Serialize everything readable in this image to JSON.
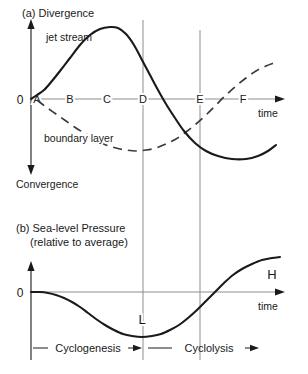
{
  "figure": {
    "width": 308,
    "height": 374,
    "background": "#ffffff",
    "ink": "#1a1a1a",
    "grid_color": "#8d8d8d"
  },
  "panel_a": {
    "title": "(a) Divergence",
    "axis_top_label": "Divergence",
    "axis_bottom_label": "Convergence",
    "x_axis_label": "time",
    "zero_label": "0",
    "tick_labels": [
      "A",
      "B",
      "C",
      "D",
      "E",
      "F"
    ],
    "tick_x": [
      37,
      70,
      107,
      143,
      200,
      243
    ],
    "curves": [
      {
        "name": "jet stream",
        "style": "solid",
        "label": "jet stream",
        "label_x": 46,
        "label_y": 41,
        "points": [
          [
            31,
            99
          ],
          [
            37,
            95
          ],
          [
            44,
            90
          ],
          [
            52,
            81
          ],
          [
            60,
            71
          ],
          [
            70,
            58
          ],
          [
            80,
            45
          ],
          [
            90,
            35
          ],
          [
            100,
            29
          ],
          [
            110,
            27
          ],
          [
            118,
            28
          ],
          [
            126,
            34
          ],
          [
            134,
            45
          ],
          [
            142,
            60
          ],
          [
            150,
            75
          ],
          [
            158,
            90
          ],
          [
            166,
            104
          ],
          [
            175,
            118
          ],
          [
            184,
            131
          ],
          [
            195,
            143
          ],
          [
            206,
            151
          ],
          [
            218,
            156
          ],
          [
            232,
            159
          ],
          [
            246,
            159
          ],
          [
            258,
            156
          ],
          [
            268,
            151
          ],
          [
            276,
            145
          ]
        ]
      },
      {
        "name": "boundary layer",
        "style": "dashed",
        "label": "boundary layer",
        "label_x": 44,
        "label_y": 142,
        "points": [
          [
            37,
            100
          ],
          [
            46,
            107
          ],
          [
            56,
            114
          ],
          [
            66,
            121
          ],
          [
            76,
            128
          ],
          [
            86,
            134
          ],
          [
            96,
            140
          ],
          [
            106,
            145
          ],
          [
            116,
            148
          ],
          [
            126,
            150
          ],
          [
            136,
            151
          ],
          [
            146,
            150
          ],
          [
            156,
            148
          ],
          [
            166,
            144
          ],
          [
            176,
            139
          ],
          [
            186,
            132
          ],
          [
            196,
            124
          ],
          [
            206,
            115
          ],
          [
            216,
            105
          ],
          [
            226,
            95
          ],
          [
            236,
            86
          ],
          [
            246,
            78
          ],
          [
            256,
            71
          ],
          [
            266,
            66
          ],
          [
            274,
            63
          ]
        ]
      }
    ],
    "geometry": {
      "y_axis_x": 31,
      "baseline_y": 99,
      "axis_top_y": 20,
      "axis_bottom_y": 172,
      "x_axis_end": 284,
      "time_label_x": 258,
      "time_label_y": 117
    }
  },
  "panel_b": {
    "title_line1": "(b) Sea-level Pressure",
    "title_line2": "(relative to average)",
    "x_axis_label": "time",
    "zero_label": "0",
    "low_marker": "L",
    "high_marker": "H",
    "low_marker_x": 142,
    "low_marker_y": 320,
    "high_marker_x": 272,
    "high_marker_y": 275,
    "curve": {
      "name": "sea-level pressure",
      "style": "solid",
      "points": [
        [
          31,
          292
        ],
        [
          40,
          292
        ],
        [
          48,
          293
        ],
        [
          56,
          295
        ],
        [
          64,
          298
        ],
        [
          72,
          302
        ],
        [
          80,
          307
        ],
        [
          88,
          313
        ],
        [
          96,
          319
        ],
        [
          105,
          325
        ],
        [
          114,
          330
        ],
        [
          123,
          334
        ],
        [
          132,
          336
        ],
        [
          142,
          337
        ],
        [
          152,
          336
        ],
        [
          161,
          334
        ],
        [
          170,
          330
        ],
        [
          179,
          325
        ],
        [
          188,
          318
        ],
        [
          197,
          310
        ],
        [
          206,
          301
        ],
        [
          215,
          292
        ],
        [
          224,
          283
        ],
        [
          233,
          275
        ],
        [
          242,
          269
        ],
        [
          252,
          264
        ],
        [
          262,
          260
        ],
        [
          272,
          258
        ],
        [
          280,
          257
        ]
      ]
    },
    "phases": [
      {
        "label": "Cyclogenesis",
        "start_x": 33,
        "end_x": 142,
        "text_x": 88,
        "text_y": 352
      },
      {
        "label": "Cyclolysis",
        "start_x": 146,
        "end_x": 258,
        "text_x": 206,
        "text_y": 352
      }
    ],
    "geometry": {
      "y_axis_x": 31,
      "baseline_y": 292,
      "axis_top_y": 262,
      "x_axis_end": 284,
      "time_label_x": 258,
      "time_label_y": 310,
      "phase_rule_y": 348
    }
  },
  "gridlines": [
    {
      "name": "gridline-D",
      "x": 143,
      "y1": 20,
      "y2": 360
    },
    {
      "name": "gridline-E",
      "x": 200,
      "y1": 30,
      "y2": 360
    }
  ],
  "chart_data": {
    "type": "line",
    "panels": [
      {
        "id": "a",
        "title": "(a) Divergence",
        "ylabel_positive": "Divergence",
        "ylabel_negative": "Convergence",
        "xlabel": "time",
        "xticks": [
          "A",
          "B",
          "C",
          "D",
          "E",
          "F"
        ],
        "grid": false,
        "legend": "inline-labels",
        "series": [
          {
            "name": "jet stream",
            "style": "solid",
            "description": "Rises from near zero at A to maximum divergence between C and D, falls through zero just after D, reaches minimum (convergence) near F, then recovers slightly.",
            "values_at_ticks": [
              0.02,
              0.35,
              0.85,
              0.62,
              -0.52,
              -0.72
            ]
          },
          {
            "name": "boundary layer",
            "style": "dashed",
            "description": "Falls from zero at A to minimum convergence near D, then rises steadily, crossing zero after F.",
            "values_at_ticks": [
              0.0,
              -0.38,
              -0.56,
              -0.66,
              -0.28,
              0.18
            ]
          }
        ],
        "ylim": [
          -1,
          1
        ],
        "zero_line": 0
      },
      {
        "id": "b",
        "title": "(b) Sea-level Pressure (relative to average)",
        "xlabel": "time",
        "ylabel": "Sea-level Pressure (relative to average)",
        "grid": false,
        "annotations": [
          {
            "text": "L",
            "meaning": "lowest pressure",
            "at_tick": "D"
          },
          {
            "text": "H",
            "meaning": "highest pressure",
            "at_tick": "after F"
          },
          {
            "text": "Cyclogenesis",
            "span": [
              "A",
              "D"
            ]
          },
          {
            "text": "Cyclolysis",
            "span": [
              "D",
              "F"
            ]
          }
        ],
        "series": [
          {
            "name": "sea-level pressure",
            "style": "solid",
            "description": "Flat at zero near A, falls to a minimum at D (marked L), then rises through zero near E and continues up to a high (marked H).",
            "values_at_ticks": [
              0.0,
              -0.18,
              -0.62,
              -0.9,
              -0.3,
              0.55
            ]
          }
        ],
        "ylim": [
          -1,
          1
        ],
        "zero_line": 0
      }
    ]
  }
}
